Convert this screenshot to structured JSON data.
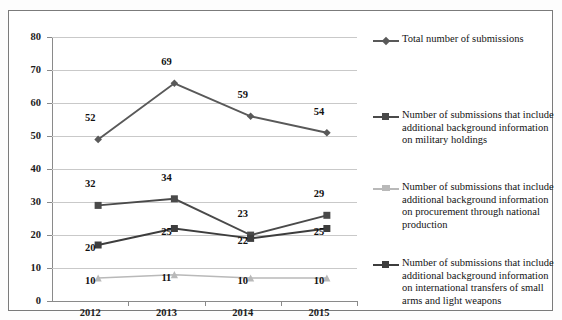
{
  "chart_data": {
    "type": "line",
    "title": "",
    "xlabel": "",
    "ylabel": "",
    "categories": [
      "2012",
      "2013",
      "2014",
      "2015"
    ],
    "ylim": [
      0,
      80
    ],
    "yticks": [
      0,
      10,
      20,
      30,
      40,
      50,
      60,
      70,
      80
    ],
    "grid": true,
    "legend_position": "right",
    "series": [
      {
        "name": "Total number of submissions",
        "values": [
          52,
          69,
          59,
          54
        ],
        "color": "#595959",
        "marker": "diamond",
        "label_offsets": [
          "above",
          "above",
          "above",
          "above"
        ]
      },
      {
        "name": "Number of submissions that include additional background information on military holdings",
        "values": [
          32,
          34,
          23,
          29
        ],
        "color": "#4a4a4a",
        "marker": "square",
        "label_offsets": [
          "above",
          "above",
          "above",
          "above"
        ]
      },
      {
        "name": "Number of submissions that include additional background information on procurement through national production",
        "values": [
          10,
          11,
          10,
          10
        ],
        "color": "#b9b9b9",
        "marker": "triangle",
        "label_offsets": [
          "below",
          "below",
          "below",
          "below"
        ]
      },
      {
        "name": "Number of submissions that include additional background information on international transfers of small arms and light weapons",
        "values": [
          20,
          25,
          22,
          25
        ],
        "color": "#3d3d3d",
        "marker": "square",
        "label_offsets": [
          "below",
          "below",
          "below",
          "below"
        ]
      }
    ]
  },
  "axis": {
    "y_tick_labels": [
      "80",
      "70",
      "60",
      "50",
      "40",
      "30",
      "20",
      "10",
      "0"
    ],
    "x_tick_labels": [
      "2012",
      "2013",
      "2014",
      "2015"
    ]
  },
  "point_labels": {
    "total": [
      "52",
      "69",
      "59",
      "54"
    ],
    "military_holdings": [
      "32",
      "34",
      "23",
      "29"
    ],
    "national_production": [
      "10",
      "11",
      "10",
      "10"
    ],
    "small_arms": [
      "20",
      "25",
      "22",
      "25"
    ]
  },
  "legend": {
    "entries": [
      {
        "label": "Total number of submissions",
        "marker": "diamond",
        "color": "#595959"
      },
      {
        "label": "Number of submissions that include additional background information on military holdings",
        "marker": "square",
        "color": "#4a4a4a"
      },
      {
        "label": "Number of submissions that include additional background information on procurement through national production",
        "marker": "triangle",
        "color": "#b9b9b9"
      },
      {
        "label": "Number of submissions that include additional background information on international transfers of small arms and light weapons",
        "marker": "square",
        "color": "#3d3d3d"
      }
    ]
  }
}
